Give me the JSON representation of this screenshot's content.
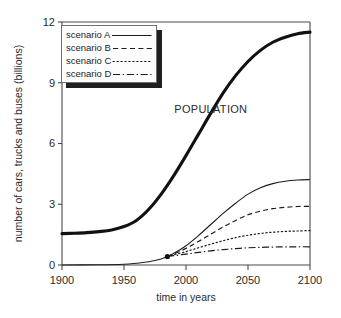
{
  "figure": {
    "background_color": "#ffffff",
    "line_color": "#1c1c1c",
    "population_line_color": "#111111"
  },
  "legend": {
    "position": "top-left-inside",
    "has_drop_shadow": true,
    "shadow_color": "#202020",
    "entries": [
      {
        "label": "scenario A",
        "style": "solid"
      },
      {
        "label": "scenario B",
        "style": "dashed"
      },
      {
        "label": "scenario C",
        "style": "dotted"
      },
      {
        "label": "scenario D",
        "style": "dash-dot"
      }
    ]
  },
  "chart_data": {
    "type": "line",
    "title": "",
    "subtitle": "",
    "xlabel": "time in years",
    "ylabel": "number of cars, trucks and buses (billions)",
    "xlim": [
      1900,
      2100
    ],
    "ylim": [
      0,
      12
    ],
    "xticks": [
      1900,
      1950,
      2000,
      2050,
      2100
    ],
    "xtick_labels": [
      "1900",
      "1950",
      "2000",
      "2050",
      "2100"
    ],
    "yticks": [
      0,
      3,
      6,
      9,
      12
    ],
    "ytick_labels": [
      "0",
      "3",
      "6",
      "9",
      "12"
    ],
    "grid": false,
    "legend_position": "upper left",
    "annotations": [
      {
        "text": "POPULATION",
        "x": 2020,
        "y": 7.5
      }
    ],
    "markers": [
      {
        "label": "branch point",
        "x": 1985,
        "y": 0.42
      }
    ],
    "series": [
      {
        "name": "POPULATION",
        "style": "solid-thick",
        "x": [
          1900,
          1910,
          1920,
          1930,
          1940,
          1950,
          1960,
          1970,
          1980,
          1990,
          2000,
          2010,
          2020,
          2030,
          2040,
          2050,
          2060,
          2070,
          2080,
          2090,
          2100
        ],
        "values": [
          1.55,
          1.57,
          1.6,
          1.65,
          1.73,
          1.9,
          2.2,
          2.75,
          3.5,
          4.4,
          5.4,
          6.45,
          7.5,
          8.5,
          9.35,
          10.05,
          10.6,
          11.0,
          11.25,
          11.42,
          11.5
        ]
      },
      {
        "name": "scenario A",
        "style": "solid",
        "x": [
          1900,
          1930,
          1950,
          1960,
          1970,
          1980,
          1985,
          1990,
          2000,
          2010,
          2020,
          2030,
          2040,
          2050,
          2060,
          2070,
          2080,
          2090,
          2100
        ],
        "values": [
          0.0,
          0.01,
          0.04,
          0.09,
          0.16,
          0.3,
          0.42,
          0.57,
          0.95,
          1.45,
          2.0,
          2.55,
          3.05,
          3.5,
          3.82,
          4.02,
          4.14,
          4.2,
          4.22
        ]
      },
      {
        "name": "scenario B",
        "style": "dashed",
        "x": [
          1985,
          1990,
          2000,
          2010,
          2020,
          2030,
          2040,
          2050,
          2060,
          2070,
          2080,
          2090,
          2100
        ],
        "values": [
          0.42,
          0.54,
          0.82,
          1.16,
          1.52,
          1.88,
          2.2,
          2.48,
          2.66,
          2.78,
          2.85,
          2.89,
          2.9
        ]
      },
      {
        "name": "scenario C",
        "style": "dotted",
        "x": [
          1985,
          1990,
          2000,
          2010,
          2020,
          2030,
          2040,
          2050,
          2060,
          2070,
          2080,
          2090,
          2100
        ],
        "values": [
          0.42,
          0.5,
          0.66,
          0.85,
          1.03,
          1.2,
          1.35,
          1.47,
          1.56,
          1.62,
          1.66,
          1.68,
          1.7
        ]
      },
      {
        "name": "scenario D",
        "style": "dash-dot",
        "x": [
          1985,
          1990,
          2000,
          2010,
          2020,
          2030,
          2040,
          2050,
          2060,
          2070,
          2080,
          2090,
          2100
        ],
        "values": [
          0.42,
          0.46,
          0.54,
          0.62,
          0.7,
          0.76,
          0.81,
          0.85,
          0.87,
          0.885,
          0.895,
          0.9,
          0.9
        ]
      }
    ]
  }
}
